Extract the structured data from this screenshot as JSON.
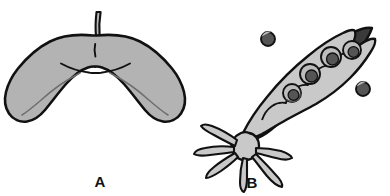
{
  "figure": {
    "type": "scientific-illustration",
    "background_color": "#ffffff",
    "panel_count": 2
  },
  "palette": {
    "outline": "#111111",
    "body_light_gray": "#b3b3b3",
    "body_pale_gray": "#c9c9c9",
    "valve_dark_gray": "#3a3a3a",
    "seed_dark_gray": "#555555",
    "seed_highlight": "#bdbdbd",
    "vein_line": "#6e6e6e",
    "background": "#ffffff",
    "label_color": "#111111"
  },
  "panels": [
    {
      "id": "A",
      "label": "A",
      "name": "winged-samara",
      "description": "double-winged maple samara with central seed body and slender stalk",
      "label_x": 100,
      "label_y": 187,
      "parts": [
        {
          "name": "stalk",
          "count": 1
        },
        {
          "name": "seed-body",
          "count": 1
        },
        {
          "name": "wing-left",
          "count": 1
        },
        {
          "name": "wing-right",
          "count": 1
        },
        {
          "name": "wing-vein",
          "count": 2
        },
        {
          "name": "seed-notch",
          "count": 1
        }
      ]
    },
    {
      "id": "B",
      "label": "B",
      "name": "split-seed-pod",
      "description": "dehisced legume pod tilted diagonally, upper pale valve opened to reveal four seeds, dark lower valve, calyx with radiating sepal tendrils at base, two released seeds floating free",
      "label_x": 252,
      "label_y": 188,
      "parts": [
        {
          "name": "pod-upper-valve",
          "count": 1
        },
        {
          "name": "pod-lower-valve",
          "count": 1
        },
        {
          "name": "pod-seed",
          "count": 4
        },
        {
          "name": "released-seed",
          "count": 2
        },
        {
          "name": "calyx",
          "count": 1
        },
        {
          "name": "sepal-tendril",
          "count": 6
        }
      ],
      "pod_seeds": [
        {
          "index": 1,
          "cx": 292,
          "cy": 93,
          "r": 9
        },
        {
          "index": 2,
          "cx": 310,
          "cy": 74,
          "r": 10
        },
        {
          "index": 3,
          "cx": 331,
          "cy": 57,
          "r": 10
        },
        {
          "index": 4,
          "cx": 352,
          "cy": 50,
          "r": 9
        }
      ],
      "released_seeds": [
        {
          "index": 1,
          "cx": 268,
          "cy": 39,
          "r": 7
        },
        {
          "index": 2,
          "cx": 363,
          "cy": 89,
          "r": 7
        }
      ]
    }
  ]
}
